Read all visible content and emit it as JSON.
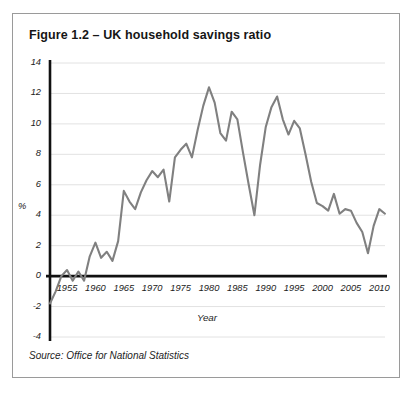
{
  "figure": {
    "title": "Figure 1.2 – UK household savings ratio",
    "source": "Source: Office for National Statistics"
  },
  "chart_data": {
    "type": "line",
    "title": "Figure 1.2 – UK household savings ratio",
    "xlabel": "Year",
    "ylabel": "%",
    "xlim": [
      1952,
      2011
    ],
    "ylim": [
      -4,
      14
    ],
    "ytick_labels": [
      "14",
      "12",
      "10",
      "8",
      "6",
      "4",
      "2",
      "0",
      "-2",
      "-4"
    ],
    "ytick_values": [
      14,
      12,
      10,
      8,
      6,
      4,
      2,
      0,
      -2,
      -4
    ],
    "xtick_labels": [
      "1955",
      "1960",
      "1965",
      "1970",
      "1975",
      "1980",
      "1985",
      "1990",
      "1995",
      "2000",
      "2005",
      "2010"
    ],
    "xtick_values": [
      1955,
      1960,
      1965,
      1970,
      1975,
      1980,
      1985,
      1990,
      1995,
      2000,
      2005,
      2010
    ],
    "grid": true,
    "grid_axis": "y",
    "legend": null,
    "series": [
      {
        "name": "UK household savings ratio",
        "color": "#808080",
        "x": [
          1952,
          1953,
          1954,
          1955,
          1956,
          1957,
          1958,
          1959,
          1960,
          1961,
          1962,
          1963,
          1964,
          1965,
          1966,
          1967,
          1968,
          1969,
          1970,
          1971,
          1972,
          1973,
          1974,
          1975,
          1976,
          1977,
          1978,
          1979,
          1980,
          1981,
          1982,
          1983,
          1984,
          1985,
          1986,
          1987,
          1988,
          1989,
          1990,
          1991,
          1992,
          1993,
          1994,
          1995,
          1996,
          1997,
          1998,
          1999,
          2000,
          2001,
          2002,
          2003,
          2004,
          2005,
          2006,
          2007,
          2008,
          2009,
          2010,
          2011
        ],
        "y": [
          -1.8,
          -1.0,
          0.0,
          0.4,
          -0.3,
          0.3,
          -0.3,
          1.3,
          2.2,
          1.2,
          1.6,
          1.0,
          2.3,
          5.6,
          4.9,
          4.4,
          5.5,
          6.3,
          6.9,
          6.5,
          7.0,
          4.9,
          7.8,
          8.3,
          8.7,
          7.8,
          9.6,
          11.2,
          12.4,
          11.4,
          9.4,
          8.9,
          10.8,
          10.3,
          8.1,
          6.0,
          4.0,
          7.3,
          9.8,
          11.1,
          11.8,
          10.3,
          9.3,
          10.2,
          9.7,
          8.0,
          6.2,
          4.8,
          4.6,
          4.3,
          5.4,
          4.1,
          4.4,
          4.3,
          3.5,
          2.9,
          1.5,
          3.3,
          4.4,
          4.1
        ]
      }
    ]
  }
}
